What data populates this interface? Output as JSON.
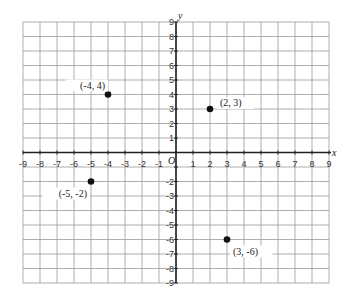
{
  "chart_data": {
    "type": "scatter",
    "title": "",
    "xlabel": "x",
    "ylabel": "y",
    "origin_label": "O",
    "xlim": [
      -9,
      9
    ],
    "ylim": [
      -9,
      9
    ],
    "grid": true,
    "x_ticks": [
      -9,
      -8,
      -7,
      -6,
      -5,
      -4,
      -3,
      -2,
      -1,
      1,
      2,
      3,
      4,
      5,
      6,
      7,
      8,
      9
    ],
    "y_ticks": [
      9,
      8,
      7,
      6,
      5,
      4,
      3,
      2,
      1,
      -2,
      -3,
      -4,
      -5,
      -6,
      -7,
      -8,
      -9
    ],
    "points": [
      {
        "x": -4,
        "y": 4,
        "label": "(-4, 4)"
      },
      {
        "x": 2,
        "y": 3,
        "label": "(2, 3)"
      },
      {
        "x": -5,
        "y": -2,
        "label": "(-5, -2)"
      },
      {
        "x": 3,
        "y": -6,
        "label": "(3, -6)"
      }
    ],
    "color": "#111111"
  }
}
